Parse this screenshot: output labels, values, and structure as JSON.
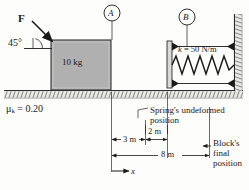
{
  "figure": {
    "background_color": "#fdfdfb",
    "ink_color": "#1a1a1a"
  },
  "force": {
    "label": "F",
    "angle_label": "45°",
    "direction": "down-right",
    "applied_at": "top-left-corner-of-block"
  },
  "block": {
    "mass_label": "10 kg",
    "fill_color": "#b0b0b0",
    "stroke_color": "#333333"
  },
  "friction": {
    "symbol": "μ",
    "subscript": "k",
    "equals": " = ",
    "value": "0.20",
    "full_label": "μk = 0.20"
  },
  "spring": {
    "symbol": "k",
    "subscript": "",
    "stiffness_label": "= 50 N/m",
    "full_label": "k = 50 N/m",
    "coils": 9
  },
  "markers": [
    {
      "id": "A",
      "label": "A",
      "points_to": "block-top"
    },
    {
      "id": "B",
      "label": "B",
      "points_to": "spring-top"
    }
  ],
  "dimensions": [
    {
      "id": "d3",
      "label": "3 m"
    },
    {
      "id": "d2",
      "label": "2 m"
    },
    {
      "id": "d8",
      "label": "8 m"
    }
  ],
  "axis": {
    "label": "x",
    "direction": "right"
  },
  "annotations": [
    {
      "id": "spring-undeformed",
      "line1": "Spring's undeformed",
      "line2": "position"
    },
    {
      "id": "block-final",
      "line1": "Block's",
      "line2": "final",
      "line3": "position"
    }
  ]
}
